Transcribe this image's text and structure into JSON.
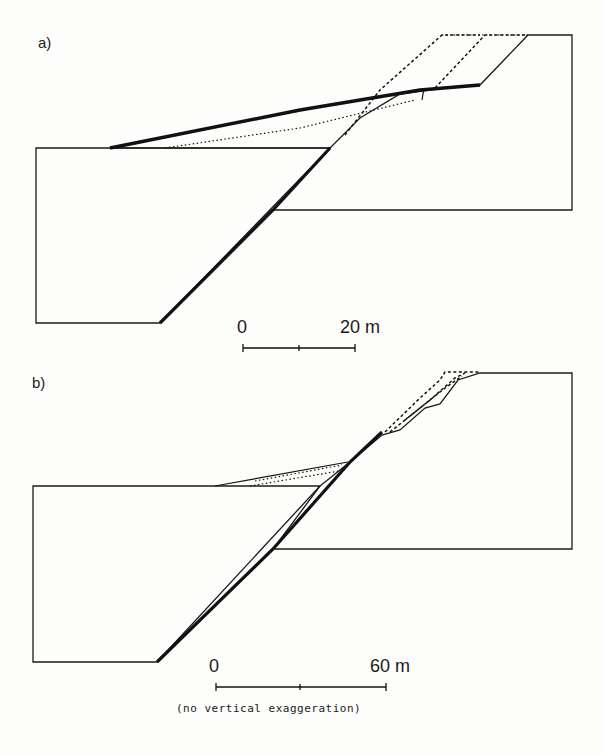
{
  "figure": {
    "panel_a": {
      "label": "a)",
      "scale": {
        "start": "0",
        "end": "20 m"
      }
    },
    "panel_b": {
      "label": "b)",
      "scale": {
        "start": "0",
        "end": "60 m"
      },
      "note": "(no vertical exaggeration)"
    },
    "colors": {
      "ink": "#1a1a1a",
      "paper": "#fdfdfb"
    }
  }
}
